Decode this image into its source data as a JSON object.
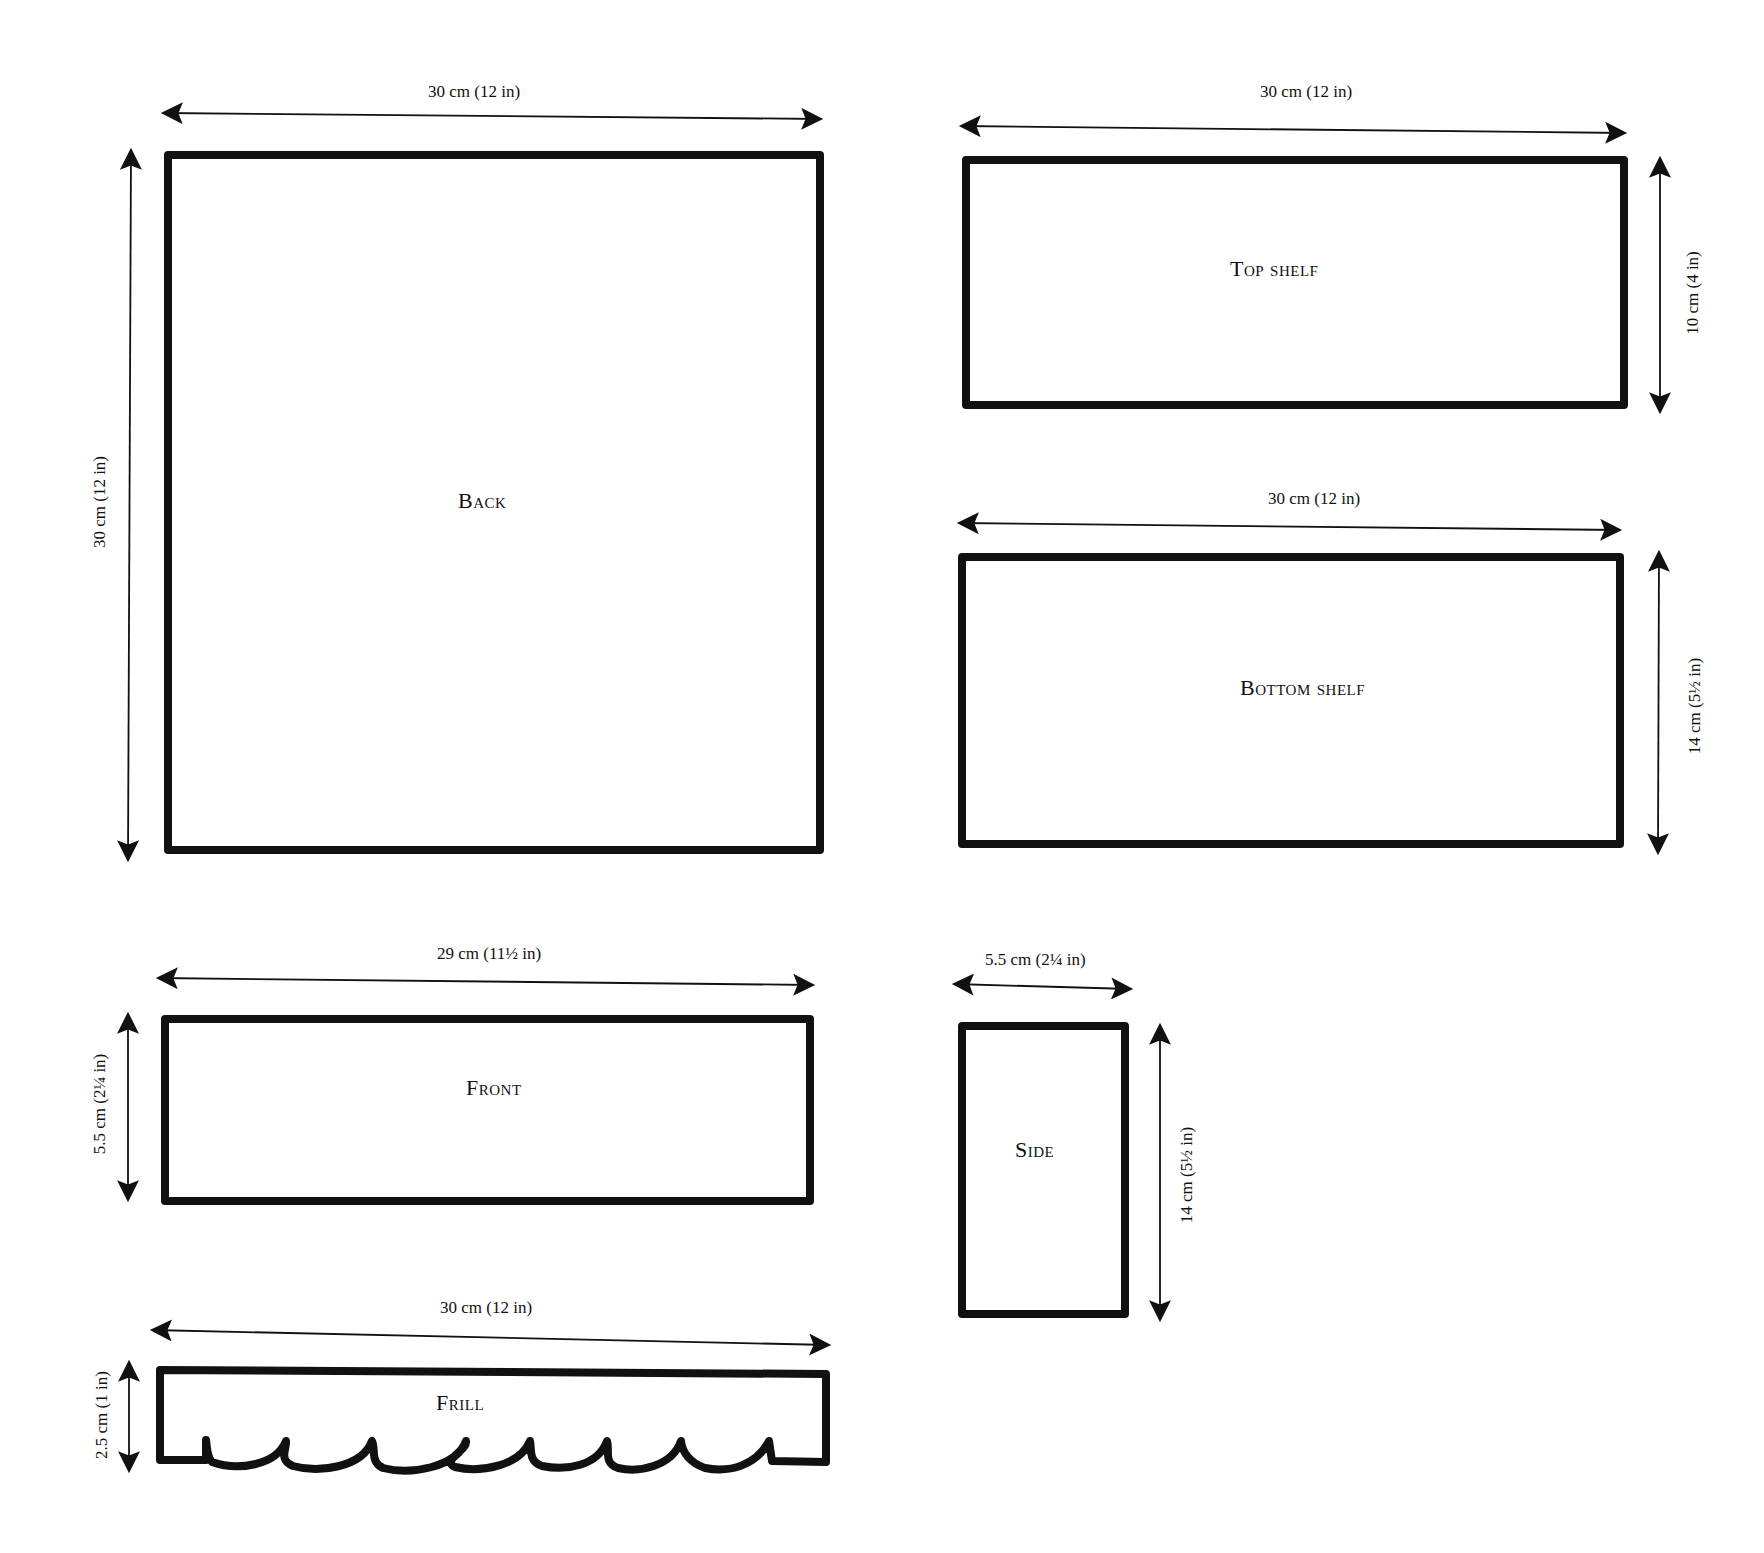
{
  "diagram": {
    "type": "pattern-templates",
    "stroke_color": "#111111",
    "background": "#ffffff",
    "pieces": [
      {
        "name": "Back",
        "width_label": "30 cm (12 in)",
        "height_label": "30 cm (12 in)"
      },
      {
        "name": "Top shelf",
        "width_label": "30 cm (12 in)",
        "height_label": "10 cm (4 in)"
      },
      {
        "name": "Bottom shelf",
        "width_label": "30 cm (12 in)",
        "height_label": "14 cm (5½ in)"
      },
      {
        "name": "Front",
        "width_label": "29 cm (11½ in)",
        "height_label": "5.5 cm (2¼ in)"
      },
      {
        "name": "Side",
        "width_label": "5.5 cm (2¼ in)",
        "height_label": "14 cm (5½ in)"
      },
      {
        "name": "Frill",
        "width_label": "30 cm (12 in)",
        "height_label": "2.5 cm (1 in)"
      }
    ]
  }
}
